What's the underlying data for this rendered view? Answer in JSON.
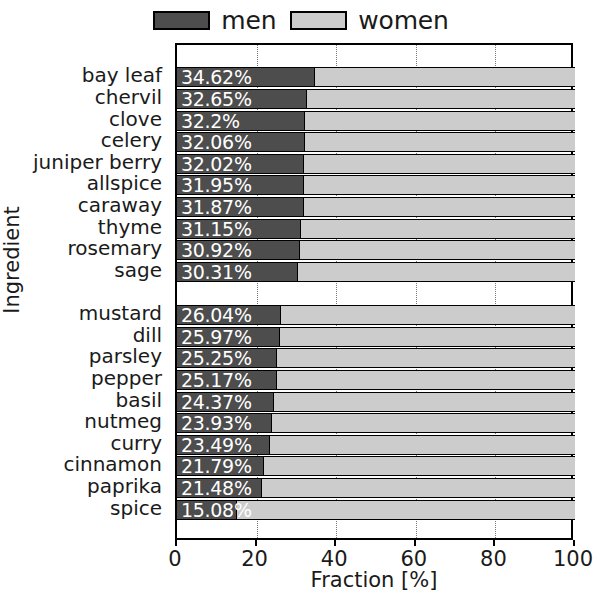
{
  "chart_data": {
    "type": "bar",
    "orientation": "horizontal",
    "stacked": true,
    "title": "",
    "xlabel": "Fraction [%]",
    "ylabel": "Ingredient",
    "xlim": [
      0,
      100
    ],
    "xticks": [
      0,
      20,
      40,
      60,
      80,
      100
    ],
    "xticklabels": [
      "0",
      "20",
      "40",
      "60",
      "80",
      "100"
    ],
    "grid": true,
    "grid_axis": "x",
    "legend": {
      "position": "top-center",
      "entries": [
        {
          "name": "men",
          "color": "#4d4d4d"
        },
        {
          "name": "women",
          "color": "#cccccc"
        }
      ]
    },
    "categories": [
      "bay leaf",
      "chervil",
      "clove",
      "celery",
      "juniper berry",
      "allspice",
      "caraway",
      "thyme",
      "rosemary",
      "sage",
      "mustard",
      "dill",
      "parsley",
      "pepper",
      "basil",
      "nutmeg",
      "curry",
      "cinnamon",
      "paprika",
      "spice"
    ],
    "group_break_after_index": 9,
    "series": [
      {
        "name": "men",
        "values": [
          34.62,
          32.65,
          32.2,
          32.06,
          32.02,
          31.95,
          31.87,
          31.15,
          30.92,
          30.31,
          26.04,
          25.97,
          25.25,
          25.17,
          24.37,
          23.93,
          23.49,
          21.79,
          21.48,
          15.08
        ]
      },
      {
        "name": "women",
        "values": [
          65.38,
          67.35,
          67.8,
          67.94,
          67.98,
          68.05,
          68.13,
          68.85,
          69.08,
          69.69,
          73.96,
          74.03,
          74.75,
          74.83,
          75.63,
          76.07,
          76.51,
          78.21,
          78.52,
          84.92
        ]
      }
    ],
    "bar_labels": [
      "34.62%",
      "32.65%",
      "32.2%",
      "32.06%",
      "32.02%",
      "31.95%",
      "31.87%",
      "31.15%",
      "30.92%",
      "30.31%",
      "26.04%",
      "25.97%",
      "25.25%",
      "25.17%",
      "24.37%",
      "23.93%",
      "23.49%",
      "21.79%",
      "21.48%",
      "15.08%"
    ],
    "colors": {
      "men": "#4d4d4d",
      "women": "#cccccc",
      "bar_label_text": "#ffffff",
      "axis": "#000000",
      "grid": "#7a7a7a"
    }
  }
}
